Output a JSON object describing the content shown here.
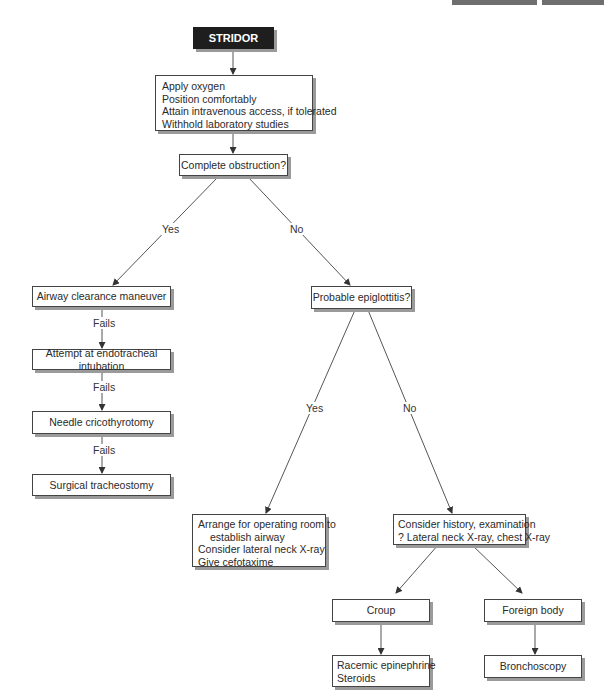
{
  "header": {
    "decoration": "gray top bars"
  },
  "start": {
    "label": "STRIDOR"
  },
  "initial_steps": {
    "lines": [
      "Apply oxygen",
      "Position comfortably",
      "Attain intravenous access, if tolerated",
      "Withhold laboratory studies"
    ]
  },
  "q1": {
    "label": "Complete obstruction?",
    "yes": "Yes",
    "no": "No"
  },
  "left_branch": {
    "steps": [
      "Airway clearance maneuver",
      "Attempt at endotracheal intubation",
      "Needle cricothyrotomy",
      "Surgical tracheostomy"
    ],
    "fail_label": "Fails"
  },
  "q2": {
    "label": "Probable epiglottitis?",
    "yes": "Yes",
    "no": "No"
  },
  "epiglottitis_yes": {
    "lines": [
      "Arrange for operating room to",
      "establish airway",
      "Consider lateral neck X-ray",
      "Give cefotaxime"
    ]
  },
  "epiglottitis_no": {
    "lines": [
      "Consider history, examination",
      "? Lateral neck X-ray, chest X-ray"
    ]
  },
  "croup": {
    "label": "Croup",
    "treatment": [
      "Racemic epinephrine",
      "Steroids"
    ]
  },
  "foreign_body": {
    "label": "Foreign body",
    "treatment": "Bronchoscopy"
  },
  "colors": {
    "line": "#555555",
    "start_fill": "#1e1e1e",
    "shadow": "#9a9a9a"
  }
}
